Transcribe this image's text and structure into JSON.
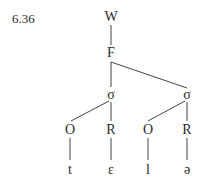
{
  "example_number": "6.36",
  "tree": {
    "nodes": [
      {
        "id": "W",
        "label": "W"
      },
      {
        "id": "F",
        "label": "F"
      },
      {
        "id": "s1",
        "label": "σ"
      },
      {
        "id": "s2",
        "label": "σ"
      },
      {
        "id": "O1",
        "label": "O"
      },
      {
        "id": "R1",
        "label": "R"
      },
      {
        "id": "O2",
        "label": "O"
      },
      {
        "id": "R2",
        "label": "R"
      },
      {
        "id": "t",
        "label": "t"
      },
      {
        "id": "e",
        "label": "ɛ"
      },
      {
        "id": "l",
        "label": "l"
      },
      {
        "id": "schwa",
        "label": "ə"
      }
    ],
    "edges": [
      [
        "W",
        "F"
      ],
      [
        "F",
        "s1"
      ],
      [
        "F",
        "s2"
      ],
      [
        "s1",
        "O1"
      ],
      [
        "s1",
        "R1"
      ],
      [
        "s2",
        "O2"
      ],
      [
        "s2",
        "R2"
      ],
      [
        "O1",
        "t"
      ],
      [
        "R1",
        "e"
      ],
      [
        "O2",
        "l"
      ],
      [
        "R2",
        "schwa"
      ]
    ]
  }
}
